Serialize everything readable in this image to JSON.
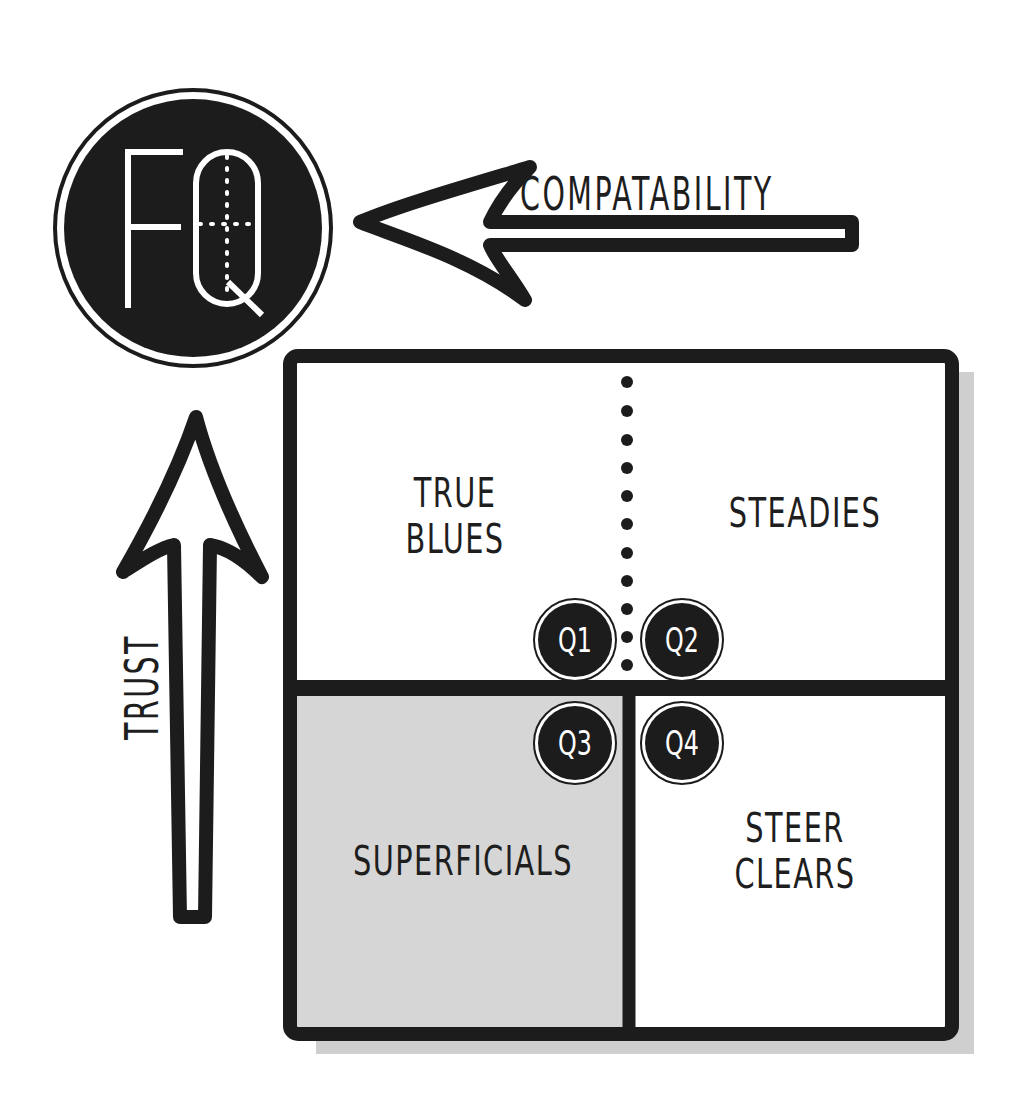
{
  "logo": {
    "text_f": "F",
    "text_q": "Q",
    "label": "FQ"
  },
  "axes": {
    "x": {
      "label": "COMPATABILITY",
      "direction": "left"
    },
    "y": {
      "label": "TRUST",
      "direction": "up"
    }
  },
  "quadrants": [
    {
      "id": "Q1",
      "badge": "Q1",
      "label_lines": [
        "TRUE",
        "BLUES"
      ],
      "fill": "#ffffff"
    },
    {
      "id": "Q2",
      "badge": "Q2",
      "label_lines": [
        "STEADIES"
      ],
      "fill": "#ffffff"
    },
    {
      "id": "Q3",
      "badge": "Q3",
      "label_lines": [
        "SUPERFICIALS"
      ],
      "fill": "#d6d6d6"
    },
    {
      "id": "Q4",
      "badge": "Q4",
      "label_lines": [
        "STEER",
        "CLEARS"
      ],
      "fill": "#ffffff"
    }
  ],
  "colors": {
    "ink": "#1c1c1c",
    "shade": "#d6d6d6",
    "shadow": "#cfcfcf",
    "background": "#ffffff"
  }
}
